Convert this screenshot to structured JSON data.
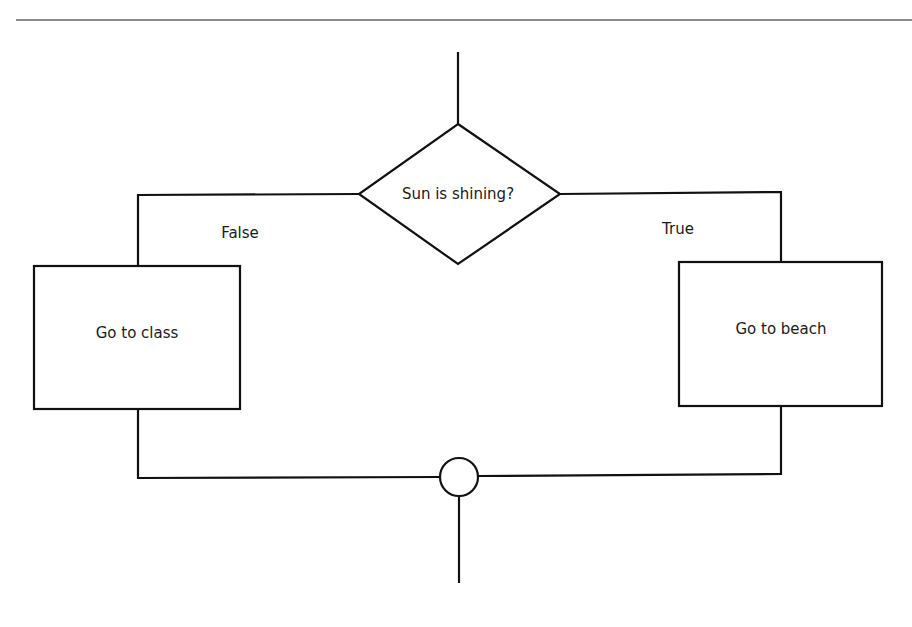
{
  "diagram": {
    "type": "flowchart",
    "decision": {
      "label": "Sun is shining?"
    },
    "branches": {
      "false": {
        "label": "False",
        "action": "Go to class"
      },
      "true": {
        "label": "True",
        "action": "Go to beach"
      }
    },
    "merge": {
      "shape": "circle"
    },
    "colors": {
      "stroke": "#111111",
      "rule": "#8c8c8c",
      "background": "#ffffff"
    }
  }
}
